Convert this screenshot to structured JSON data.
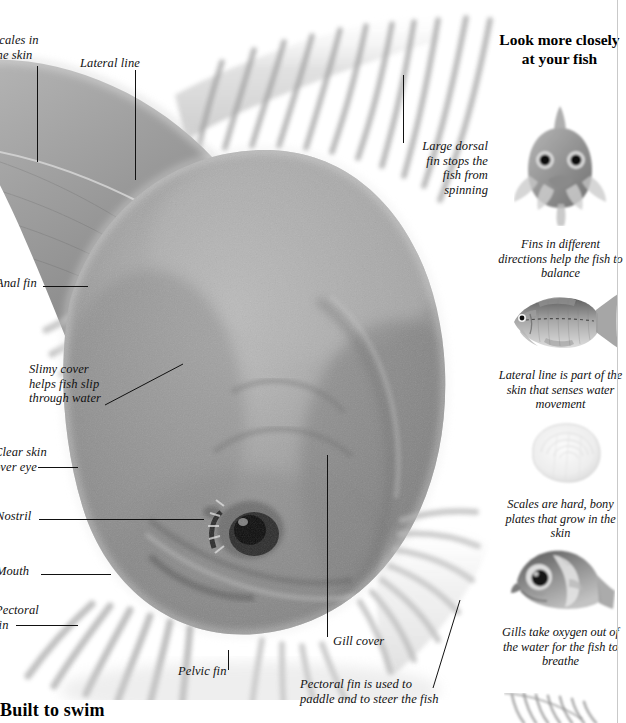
{
  "page": {
    "heading_bottom": "Built to swim",
    "background": "#ffffff",
    "ink": "#111111"
  },
  "main_figure": {
    "name": "fish-photograph",
    "description": "Large grayscale photograph of a carp seen head-on from above, filling the left portion of the page",
    "callouts": [
      {
        "id": "scales-in-the-skin",
        "text": "Scales in\nthe skin",
        "align": "left",
        "x": -7,
        "y": 33,
        "clipped_left": true
      },
      {
        "id": "lateral-line",
        "text": "Lateral line",
        "align": "left",
        "x": 80,
        "y": 56,
        "clipped_left": false
      },
      {
        "id": "large-dorsal-fin",
        "text": "Large dorsal\nfin stops the\nfish from\nspinning",
        "align": "right",
        "x": 410,
        "y": 139,
        "clipped_left": false
      },
      {
        "id": "anal-fin",
        "text": "Anal fin",
        "align": "left",
        "x": -4,
        "y": 276,
        "clipped_left": true
      },
      {
        "id": "slimy-cover",
        "text": "Slimy cover\nhelps fish slip\nthrough water",
        "align": "left",
        "x": 29,
        "y": 362,
        "clipped_left": false
      },
      {
        "id": "clear-skin-over-eye",
        "text": "Clear skin\nover eye",
        "align": "left",
        "x": -6,
        "y": 445,
        "clipped_left": true
      },
      {
        "id": "nostril",
        "text": "Nostril",
        "align": "left",
        "x": -4,
        "y": 509,
        "clipped_left": true
      },
      {
        "id": "mouth",
        "text": "Mouth",
        "align": "left",
        "x": -4,
        "y": 564,
        "clipped_left": true
      },
      {
        "id": "pectoral-fin-left",
        "text": "Pectoral\nfin",
        "align": "left",
        "x": -5,
        "y": 603,
        "clipped_left": true
      },
      {
        "id": "gill-cover",
        "text": "Gill cover",
        "align": "left",
        "x": 330,
        "y": 634,
        "clipped_left": false
      },
      {
        "id": "pelvic-fin",
        "text": "Pelvic fin",
        "align": "left",
        "x": 178,
        "y": 664,
        "clipped_left": false
      },
      {
        "id": "pectoral-fin-steer",
        "text": "Pectoral fin is used to\npaddle and to steer the fish",
        "align": "left",
        "x": 300,
        "y": 677,
        "clipped_left": false
      }
    ]
  },
  "sidebar": {
    "title": "Look more\nclosely at\nyour fish",
    "entries": [
      {
        "id": "fins-balance",
        "thumb_name": "fish-front-view-thumbnail",
        "thumb_desc": "Head-on view of a fish showing paired fins spread in different directions",
        "caption": "Fins in different\ndirections help the\nfish to balance"
      },
      {
        "id": "lateral-line-skin",
        "thumb_name": "fish-side-view-thumbnail",
        "thumb_desc": "Side view of a whole fish with a dashed lateral line running along its flank",
        "caption": "Lateral line is part\nof the skin that senses\nwater movement"
      },
      {
        "id": "scales-bony-plates",
        "thumb_name": "single-scale-thumbnail",
        "thumb_desc": "Close-up of one pale translucent fish scale with concentric growth rings",
        "caption": "Scales are hard,\nbony plates that\ngrow in the skin"
      },
      {
        "id": "gills-oxygen",
        "thumb_name": "fish-head-gill-thumbnail",
        "thumb_desc": "Close-up of a fish head showing the eye and the lifted gill cover",
        "caption": "Gills take\noxygen out of the\nwater for the fish\nto breathe"
      },
      {
        "id": "gill-filaments-partial",
        "thumb_name": "gill-filaments-thumbnail",
        "thumb_desc": "Partially visible close-up of red gill filaments at the page edge",
        "caption": ""
      }
    ]
  }
}
